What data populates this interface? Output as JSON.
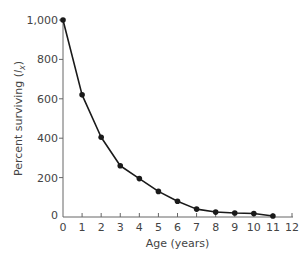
{
  "chart_data": {
    "type": "line",
    "title": "",
    "xlabel": "Age (years)",
    "ylabel_prefix": "Percent surviving (",
    "ylabel_var": "l",
    "ylabel_sub": "x",
    "ylabel_suffix": ")",
    "ylabel": "Percent surviving (lx)",
    "xlim": [
      0,
      12
    ],
    "ylim": [
      0,
      1000
    ],
    "x_ticks": [
      0,
      1,
      2,
      3,
      4,
      5,
      6,
      7,
      8,
      9,
      10,
      11,
      12
    ],
    "y_ticks": [
      0,
      200,
      400,
      600,
      800,
      1000
    ],
    "y_tick_labels": [
      "0",
      "200",
      "400",
      "600",
      "800",
      "1,000"
    ],
    "grid": false,
    "legend": null,
    "series": [
      {
        "name": "Survivorship",
        "x": [
          0,
          1,
          2,
          3,
          4,
          5,
          6,
          7,
          8,
          9,
          10,
          11
        ],
        "values": [
          1000,
          620,
          405,
          260,
          195,
          130,
          80,
          40,
          25,
          20,
          18,
          5
        ],
        "color": "#1a1a1a",
        "marker": "circle"
      }
    ]
  }
}
